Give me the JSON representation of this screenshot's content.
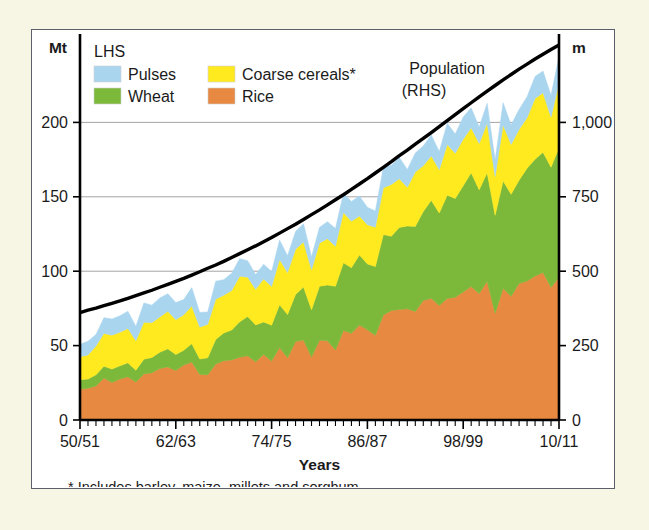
{
  "figure": {
    "left_axis_unit": "Mt",
    "right_axis_unit": "m",
    "xaxis_title": "Years",
    "footnote": "* Includes barley, maize, millets and sorghum",
    "series_annotation_line1": "Population",
    "series_annotation_line2": "(RHS)"
  },
  "legend": {
    "group_label": "LHS",
    "items": [
      {
        "label": "Pulses",
        "color": "#a9d5ef"
      },
      {
        "label": "Coarse cereals*",
        "color": "#ffe91f"
      },
      {
        "label": "Wheat",
        "color": "#7cb93a"
      },
      {
        "label": "Rice",
        "color": "#e78941"
      }
    ]
  },
  "colors": {
    "pulses": "#a9d5ef",
    "coarse_cereals": "#ffe91f",
    "wheat": "#7cb93a",
    "rice": "#e78941",
    "population_line": "#000000",
    "panel_background": "#ffffff",
    "page_background": "#f7f5e4",
    "panel_border": "#5a5f6b",
    "gridline": "#9a9a9a"
  },
  "chart_data": {
    "type": "area",
    "title": "",
    "subtitle": "",
    "stacked": true,
    "xlabel": "Years",
    "ylabel": "Mt",
    "y2label": "m",
    "ylim": [
      0,
      250
    ],
    "y2lim": [
      0,
      1250
    ],
    "yticks": [
      0,
      50,
      100,
      150,
      200
    ],
    "yticklabels": [
      "0",
      "50",
      "100",
      "150",
      "200"
    ],
    "y2ticks": [
      0,
      250,
      500,
      750,
      1000
    ],
    "y2ticklabels": [
      "0",
      "250",
      "500",
      "750",
      "1,000"
    ],
    "grid": true,
    "grid_axis": "y",
    "legend_position": "top-left",
    "xtick_positions": [
      0,
      12,
      24,
      36,
      48,
      60
    ],
    "xticklabels": [
      "50/51",
      "62/63",
      "74/75",
      "86/87",
      "98/99",
      "10/11"
    ],
    "x": [
      "50/51",
      "51/52",
      "52/53",
      "53/54",
      "54/55",
      "55/56",
      "56/57",
      "57/58",
      "58/59",
      "59/60",
      "60/61",
      "61/62",
      "62/63",
      "63/64",
      "64/65",
      "65/66",
      "66/67",
      "67/68",
      "68/69",
      "69/70",
      "70/71",
      "71/72",
      "72/73",
      "73/74",
      "74/75",
      "75/76",
      "76/77",
      "77/78",
      "78/79",
      "79/80",
      "80/81",
      "81/82",
      "82/83",
      "83/84",
      "84/85",
      "85/86",
      "86/87",
      "87/88",
      "88/89",
      "89/90",
      "90/91",
      "91/92",
      "92/93",
      "93/94",
      "94/95",
      "95/96",
      "96/97",
      "97/98",
      "98/99",
      "99/00",
      "00/01",
      "01/02",
      "02/03",
      "03/04",
      "04/05",
      "05/06",
      "06/07",
      "07/08",
      "08/09",
      "09/10",
      "10/11"
    ],
    "series": [
      {
        "name": "Rice",
        "color": "#e78941",
        "values": [
          20.6,
          21.3,
          22.9,
          28.2,
          25.2,
          27.6,
          29.0,
          25.5,
          30.9,
          31.7,
          34.6,
          35.7,
          33.2,
          37.0,
          39.0,
          30.6,
          30.4,
          37.6,
          39.8,
          40.4,
          42.2,
          43.1,
          39.2,
          44.1,
          39.6,
          48.7,
          41.9,
          52.7,
          53.8,
          42.3,
          53.6,
          53.2,
          47.1,
          60.1,
          58.3,
          63.8,
          60.6,
          56.9,
          70.5,
          73.6,
          74.3,
          74.7,
          72.9,
          80.3,
          81.8,
          77.0,
          81.7,
          82.5,
          86.1,
          89.7,
          85.0,
          93.3,
          71.8,
          88.5,
          83.1,
          91.8,
          93.4,
          96.7,
          99.2,
          89.1,
          96.0
        ]
      },
      {
        "name": "Wheat",
        "color": "#7cb93a",
        "values": [
          6.5,
          6.2,
          7.5,
          8.0,
          9.0,
          8.8,
          9.4,
          8.0,
          10.0,
          10.3,
          11.0,
          12.1,
          10.8,
          9.9,
          12.3,
          10.4,
          11.4,
          16.5,
          18.7,
          20.1,
          23.8,
          26.4,
          24.7,
          21.8,
          24.1,
          28.8,
          29.0,
          31.7,
          35.5,
          31.8,
          36.3,
          37.5,
          42.8,
          45.5,
          44.1,
          47.1,
          44.3,
          46.2,
          54.1,
          49.9,
          55.1,
          55.7,
          57.2,
          59.8,
          65.8,
          62.1,
          69.4,
          66.3,
          71.3,
          76.4,
          69.7,
          72.8,
          65.8,
          72.2,
          68.6,
          69.4,
          75.8,
          78.6,
          80.7,
          80.8,
          86.9
        ]
      },
      {
        "name": "Coarse cereals",
        "color": "#ffe91f",
        "values": [
          15.4,
          16.2,
          19.4,
          22.0,
          22.8,
          22.6,
          23.1,
          19.8,
          24.8,
          23.4,
          23.7,
          25.3,
          23.4,
          23.9,
          25.3,
          21.4,
          22.5,
          27.1,
          25.4,
          26.5,
          30.6,
          26.5,
          23.9,
          28.8,
          26.1,
          30.4,
          28.2,
          30.4,
          30.4,
          26.9,
          29.0,
          31.1,
          26.9,
          33.9,
          31.1,
          26.2,
          26.3,
          26.4,
          31.4,
          34.8,
          32.7,
          26.0,
          36.6,
          30.8,
          29.9,
          29.0,
          34.1,
          30.4,
          31.3,
          30.3,
          31.1,
          33.4,
          26.1,
          37.6,
          33.5,
          34.1,
          33.9,
          40.8,
          40.0,
          33.6,
          43.4
        ]
      },
      {
        "name": "Pulses",
        "color": "#a9d5ef",
        "values": [
          8.4,
          9.2,
          7.6,
          10.6,
          10.9,
          11.0,
          11.6,
          9.6,
          13.0,
          11.8,
          12.7,
          11.8,
          11.5,
          10.1,
          12.4,
          9.9,
          8.3,
          12.1,
          10.4,
          11.7,
          11.8,
          11.1,
          9.9,
          10.0,
          10.0,
          13.0,
          11.3,
          11.9,
          12.2,
          8.6,
          10.6,
          11.5,
          11.9,
          12.9,
          13.4,
          13.4,
          11.7,
          11.0,
          13.8,
          12.9,
          14.3,
          12.0,
          12.8,
          13.3,
          14.0,
          12.3,
          14.2,
          13.0,
          14.9,
          13.4,
          11.1,
          13.4,
          11.1,
          14.9,
          13.1,
          13.4,
          14.2,
          14.8,
          14.6,
          14.7,
          18.2
        ]
      }
    ],
    "overlay_series": {
      "name": "Population",
      "axis": "right",
      "unit": "m",
      "color": "#000000",
      "values": [
        361,
        369,
        376,
        384,
        392,
        400,
        409,
        418,
        427,
        436,
        446,
        456,
        466,
        476,
        487,
        498,
        510,
        521,
        533,
        546,
        559,
        572,
        585,
        599,
        613,
        628,
        643,
        658,
        674,
        690,
        706,
        723,
        740,
        757,
        775,
        793,
        811,
        830,
        849,
        868,
        888,
        907,
        927,
        946,
        966,
        986,
        1006,
        1026,
        1046,
        1066,
        1086,
        1105,
        1124,
        1143,
        1161,
        1179,
        1196,
        1213,
        1229,
        1245,
        1260
      ]
    }
  }
}
